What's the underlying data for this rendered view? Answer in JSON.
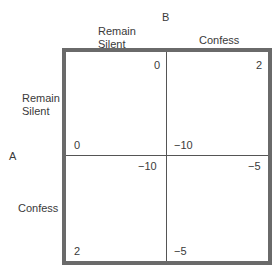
{
  "player_b": {
    "label": "B"
  },
  "player_a": {
    "label": "A"
  },
  "columns": [
    {
      "label_line1": "Remain",
      "label_line2": "Silent"
    },
    {
      "label": "Confess"
    }
  ],
  "rows": [
    {
      "label_line1": "Remain",
      "label_line2": "Silent"
    },
    {
      "label": "Confess"
    }
  ],
  "cells": {
    "silent_silent": {
      "b_payoff": "0",
      "a_payoff": "0"
    },
    "silent_confess": {
      "b_payoff": "2",
      "a_payoff": "−10"
    },
    "confess_silent": {
      "b_payoff": "−10",
      "a_payoff": "2"
    },
    "confess_confess": {
      "b_payoff": "−5",
      "a_payoff": "−5"
    }
  }
}
